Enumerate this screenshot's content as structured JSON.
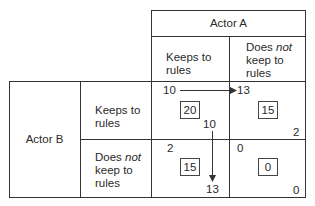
{
  "actor_a": {
    "label": "Actor A",
    "columns": [
      {
        "line1": "Keeps to",
        "line2": "rules"
      },
      {
        "line1_pre": "Does ",
        "line1_em": "not",
        "line2": "keep to",
        "line3": "rules"
      }
    ]
  },
  "actor_b": {
    "label": "Actor B",
    "rows": [
      {
        "line1": "Keeps to",
        "line2": "rules"
      },
      {
        "line1_pre": "Does ",
        "line1_em": "not",
        "line2": "keep to",
        "line3": "rules"
      }
    ]
  },
  "cells": {
    "r1c1": {
      "top_left": "10",
      "center": "20",
      "bottom_right": "10"
    },
    "r1c2": {
      "top_left": "13",
      "center": "15",
      "bottom_right": "2"
    },
    "r2c1": {
      "top_left": "2",
      "center": "15",
      "bottom_right": "13"
    },
    "r2c2": {
      "top_left": "0",
      "center": "0",
      "bottom_right": "0"
    }
  }
}
